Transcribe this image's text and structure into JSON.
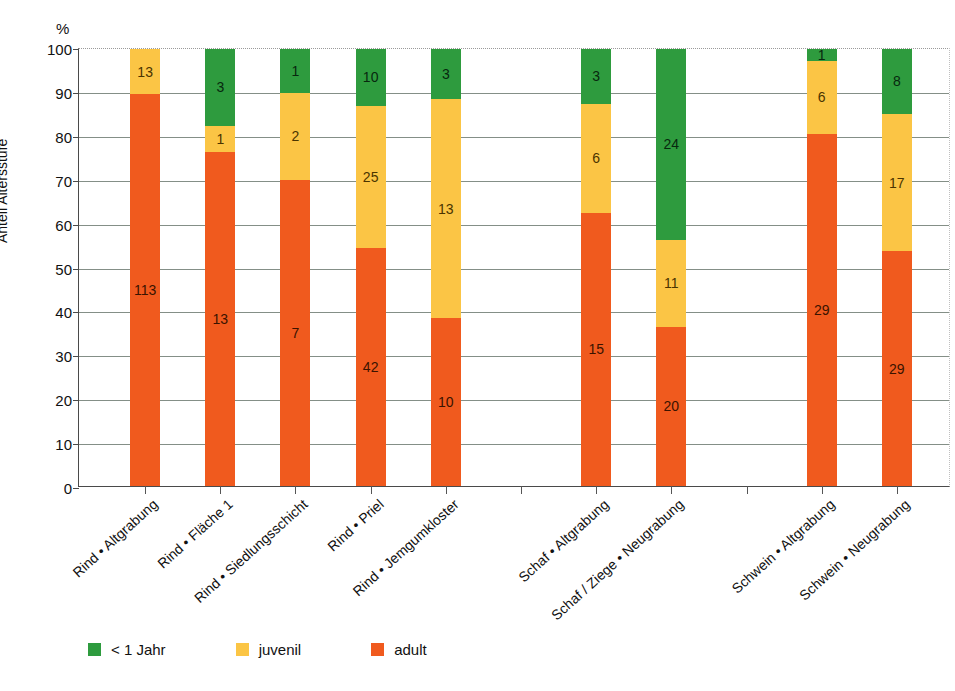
{
  "chart_data": {
    "type": "bar",
    "subtype": "stacked-percentage",
    "title": "",
    "xlabel": "",
    "ylabel": "Anteil Altersstufe",
    "unit_symbol": "%",
    "ylim": [
      0,
      100
    ],
    "y_ticks": [
      0,
      10,
      20,
      30,
      40,
      50,
      60,
      70,
      80,
      90,
      100
    ],
    "grid": true,
    "legend_position": "bottom-left",
    "categories": [
      "Rind • Altgrabung",
      "Rind • Fläche 1",
      "Rind • Siedlungsschicht",
      "Rind • Priel",
      "Rind • Jemgumkloster",
      "",
      "Schaf • Altgrabung",
      "Schaf / Ziege • Neugrabung",
      "",
      "Schwein • Altgrabung",
      "Schwein • Neugrabung"
    ],
    "series": [
      {
        "name": "adult",
        "color": "#F05A1E",
        "counts": [
          113,
          13,
          7,
          42,
          10,
          null,
          15,
          20,
          null,
          29,
          29
        ],
        "percents": [
          89.7,
          76.5,
          70.0,
          54.5,
          38.5,
          null,
          62.5,
          36.4,
          null,
          80.6,
          53.7
        ]
      },
      {
        "name": "juvenil",
        "color": "#FBC545",
        "counts": [
          13,
          1,
          2,
          25,
          13,
          null,
          6,
          11,
          null,
          6,
          17
        ],
        "percents": [
          10.3,
          5.9,
          20.0,
          32.5,
          50.0,
          null,
          25.0,
          20.0,
          null,
          16.7,
          31.5
        ]
      },
      {
        "name": "< 1 Jahr",
        "color": "#2E9B3E",
        "counts": [
          0,
          3,
          1,
          10,
          3,
          null,
          3,
          24,
          null,
          1,
          8
        ],
        "percents": [
          0.0,
          17.6,
          10.0,
          13.0,
          11.5,
          null,
          12.5,
          43.6,
          null,
          2.7,
          14.8
        ]
      }
    ],
    "totals": [
      126,
      17,
      10,
      77,
      26,
      null,
      24,
      55,
      null,
      36,
      54
    ]
  },
  "legend": {
    "items": [
      {
        "label": "< 1 Jahr",
        "color": "#2E9B3E",
        "key": "infant"
      },
      {
        "label": "juvenil",
        "color": "#FBC545",
        "key": "juvenil"
      },
      {
        "label": "adult",
        "color": "#F05A1E",
        "key": "adult"
      }
    ]
  }
}
